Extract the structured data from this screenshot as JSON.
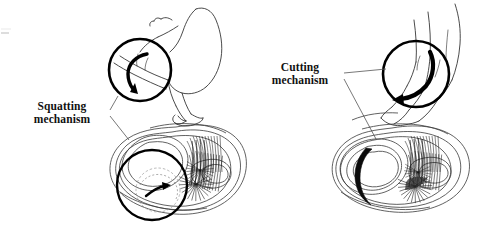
{
  "figure": {
    "background_color": "#ffffff",
    "ink_color": "#000000",
    "width": 504,
    "height": 238
  },
  "callouts": [
    {
      "id": "squatting",
      "line1": "Squatting",
      "line2": "mechanism",
      "side": "left"
    },
    {
      "id": "cutting",
      "line1": "Cutting",
      "line2": "mechanism",
      "side": "right"
    }
  ],
  "panels": {
    "left": {
      "name": "squatting-panel",
      "figure_pose": "deep squat, knees flexed, heels down",
      "magnifier_arrow": "curved-arrow-down",
      "cross_section": "meniscus transverse view with radial fiber bundles and inner magnified tear circle",
      "tear_arrow": "small-arrow-right"
    },
    "right": {
      "name": "cutting-panel",
      "figure_pose": "standing leg pivoting, knee twisted",
      "magnifier_arrow": "curved-arrow-left",
      "cross_section": "meniscus transverse view with bucket-handle crescent tear and fiber bundles"
    }
  },
  "icons": {
    "squat_arrow": "curved-rotation-arrow-icon",
    "cut_arrow": "curved-rotation-arrow-icon",
    "tear_arrow": "tear-direction-arrow-icon",
    "magnifier": "magnifier-circle-icon"
  }
}
